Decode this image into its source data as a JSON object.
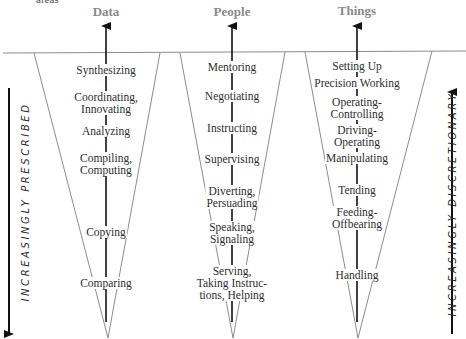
{
  "top_fragment": "areas",
  "columns": [
    {
      "heading": "Data",
      "items": [
        {
          "lines": [
            "Synthesizing"
          ]
        },
        {
          "lines": [
            "Coordinating,",
            "Innovating"
          ]
        },
        {
          "lines": [
            "Analyzing"
          ]
        },
        {
          "lines": [
            "Compiling,",
            "Computing"
          ]
        },
        {
          "lines": [
            "Copying"
          ]
        },
        {
          "lines": [
            "Comparing"
          ]
        }
      ]
    },
    {
      "heading": "People",
      "items": [
        {
          "lines": [
            "Mentoring"
          ]
        },
        {
          "lines": [
            "Negotiating"
          ]
        },
        {
          "lines": [
            "Instructing"
          ]
        },
        {
          "lines": [
            "Supervising"
          ]
        },
        {
          "lines": [
            "Diverting,",
            "Persuading"
          ]
        },
        {
          "lines": [
            "Speaking,",
            "Signaling"
          ]
        },
        {
          "lines": [
            "Serving,",
            "Taking Instruc-",
            "tions, Helping"
          ]
        }
      ]
    },
    {
      "heading": "Things",
      "items": [
        {
          "lines": [
            "Setting Up"
          ]
        },
        {
          "lines": [
            "Precision Working"
          ]
        },
        {
          "lines": [
            "Operating-",
            "Controlling"
          ]
        },
        {
          "lines": [
            "Driving-",
            "Operating"
          ]
        },
        {
          "lines": [
            "Manipulating"
          ]
        },
        {
          "lines": [
            "Tending"
          ]
        },
        {
          "lines": [
            "Feeding-",
            "Offbearing"
          ]
        },
        {
          "lines": [
            "Handling"
          ]
        }
      ]
    }
  ],
  "side_labels": {
    "left": "INCREASINGLY PRESCRIBED",
    "right": "INCREASINGLY DISCRETIONARY"
  },
  "colors": {
    "heading": "#8a8a8a",
    "text": "#2e2e2e",
    "triangle_stroke": "#8c8c8c",
    "arrow": "#111111"
  }
}
